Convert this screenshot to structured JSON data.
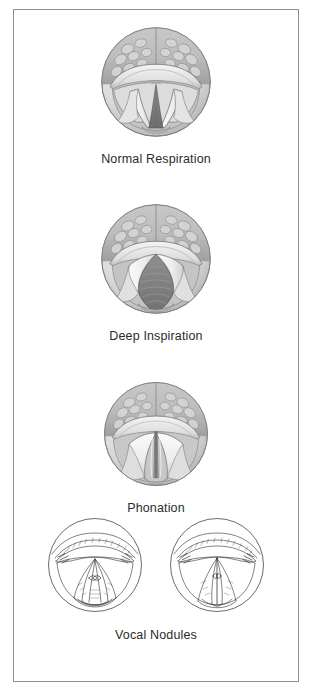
{
  "figure": {
    "border_color": "#8e8e8e",
    "background": "#ffffff",
    "caption_color": "#2b2b2b"
  },
  "palette": {
    "outline": "#5a5a5a",
    "line_dark": "#3a3a3a",
    "tissue_light": "#e6e6e6",
    "tissue_mid": "#cfcfcf",
    "tissue_shadow": "#a9a9a9",
    "tongue_base": "#c2c2c2",
    "glottis_dark": "#7c7c7c",
    "glottis_darker": "#6a6a6a",
    "line_art": "#2f2f2f"
  },
  "panels": [
    {
      "id": "normal-respiration",
      "caption": "Normal Respiration",
      "view_count": 1,
      "style": "shaded",
      "glottis_shape": "narrow-triangle",
      "glottis_state": "partially open",
      "description": "Vocal folds slightly abducted forming a narrow triangular glottal opening"
    },
    {
      "id": "deep-inspiration",
      "caption": "Deep Inspiration",
      "view_count": 1,
      "style": "shaded",
      "glottis_shape": "wide-diamond",
      "glottis_state": "fully open",
      "description": "Vocal folds maximally abducted, tracheal rings visible through the wide glottis"
    },
    {
      "id": "phonation",
      "caption": "Phonation",
      "view_count": 1,
      "style": "shaded",
      "glottis_shape": "closed-slit",
      "glottis_state": "closed",
      "description": "Vocal folds adducted to the midline forming a thin closed slit"
    },
    {
      "id": "vocal-nodules",
      "caption": "Vocal Nodules",
      "view_count": 2,
      "style": "line-art",
      "glottis_shape": "hourglass",
      "glottis_state": "nodules at midpoint",
      "description": "Line drawings showing bilateral nodules at the junction of the anterior and middle thirds of the vocal folds"
    }
  ],
  "layout": {
    "panel_tops": [
      13,
      190,
      368,
      514
    ],
    "circle_diameter": 112,
    "nodule_circle_diameter": 96
  }
}
